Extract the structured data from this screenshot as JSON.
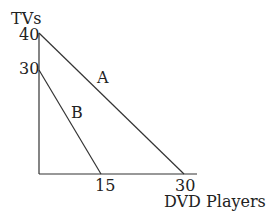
{
  "diagram": {
    "y_axis_label": "TVs",
    "x_axis_label": "DVD Players",
    "y_ticks": [
      "40",
      "30"
    ],
    "x_ticks": [
      "15",
      "30"
    ],
    "lines": [
      {
        "name": "A",
        "y_intercept": 40,
        "x_intercept": 30
      },
      {
        "name": "B",
        "y_intercept": 30,
        "x_intercept": 15
      }
    ]
  }
}
